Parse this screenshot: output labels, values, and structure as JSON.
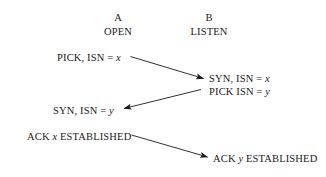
{
  "diagram": {
    "background_color": "#ffffff",
    "line_color": "#1a1a1a",
    "text_color": "#1a1a1a",
    "columns": [
      {
        "letter": "A",
        "state": "OPEN"
      },
      {
        "letter": "B",
        "state": "LISTEN"
      }
    ],
    "messages": {
      "a1_prefix": "PICK, ISN = ",
      "a1_var": "x",
      "b1_prefix": "SYN, ISN = ",
      "b1_var": "x",
      "b2_prefix": "PICK ISN = ",
      "b2_var": "y",
      "a2_prefix": "SYN, ISN = ",
      "a2_var": "y",
      "a3_prefix": "ACK ",
      "a3_var": "x",
      "a3_suffix": " ESTABLISHED",
      "b3_prefix": "ACK ",
      "b3_var": "y",
      "b3_suffix": " ESTABLISHED"
    }
  }
}
